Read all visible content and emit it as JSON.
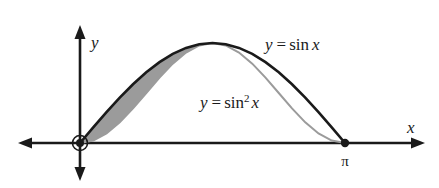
{
  "figure": {
    "background_color": "#ffffff",
    "axes": {
      "x_axis_label": "x",
      "y_axis_label": "y",
      "axis_color": "#1a1a1a",
      "origin_marker": "circled-dot",
      "x_tick_labels": [
        "π"
      ]
    },
    "labels": {
      "sin_label_y": "y",
      "sin_label_eq": "=",
      "sin_label_fn": "sin",
      "sin_label_arg": "x",
      "sin2_label_y": "y",
      "sin2_label_eq": "=",
      "sin2_label_fn": "sin",
      "sin2_label_exp": "2",
      "sin2_label_arg": "x"
    },
    "colors": {
      "sin_curve": "#1a1a1a",
      "sin2_curve": "#9b9b9b",
      "shaded_region": "#9b9b9b",
      "marker": "#1a1a1a"
    }
  },
  "chart_data": {
    "type": "line",
    "title": "",
    "xlabel": "x",
    "ylabel": "y",
    "xlim": [
      0,
      3.14159
    ],
    "ylim": [
      0,
      1
    ],
    "grid": false,
    "legend": "inline-curve-labels",
    "annotations": [
      {
        "text": "y = sin x",
        "x": 2.25,
        "y": 0.93
      },
      {
        "text": "y = sin² x",
        "x": 1.55,
        "y": 0.48
      },
      {
        "text": "π",
        "x": 3.14159,
        "y": -0.12
      }
    ],
    "markers": [
      {
        "label": "origin",
        "x": 0,
        "y": 0,
        "style": "circled-dot"
      },
      {
        "label": "π",
        "x": 3.14159,
        "y": 0,
        "style": "filled-dot"
      }
    ],
    "shaded_between": {
      "upper_series": "y = sin x",
      "lower_series": "y = sin² x",
      "x_from": 0,
      "x_to": 1.5708,
      "color": "#9b9b9b"
    },
    "series": [
      {
        "name": "y = sin x",
        "color": "#1a1a1a",
        "width": 2.6,
        "x": [
          0,
          0.1571,
          0.3142,
          0.4712,
          0.6283,
          0.7854,
          0.9425,
          1.0996,
          1.2566,
          1.4137,
          1.5708,
          1.7279,
          1.885,
          2.042,
          2.1991,
          2.3562,
          2.5133,
          2.6704,
          2.8274,
          2.9845,
          3.1416
        ],
        "values": [
          0,
          0.1564,
          0.309,
          0.454,
          0.5878,
          0.7071,
          0.809,
          0.891,
          0.9511,
          0.9877,
          1,
          0.9877,
          0.9511,
          0.891,
          0.809,
          0.7071,
          0.5878,
          0.454,
          0.309,
          0.1564,
          0
        ]
      },
      {
        "name": "y = sin² x",
        "color": "#9b9b9b",
        "width": 2.0,
        "x": [
          0,
          0.1571,
          0.3142,
          0.4712,
          0.6283,
          0.7854,
          0.9425,
          1.0996,
          1.2566,
          1.4137,
          1.5708,
          1.7279,
          1.885,
          2.042,
          2.1991,
          2.3562,
          2.5133,
          2.6704,
          2.8274,
          2.9845,
          3.1416
        ],
        "values": [
          0,
          0.0245,
          0.0955,
          0.2061,
          0.3455,
          0.5,
          0.6545,
          0.7939,
          0.9045,
          0.9755,
          1,
          0.9755,
          0.9045,
          0.7939,
          0.6545,
          0.5,
          0.3455,
          0.2061,
          0.0955,
          0.0245,
          0
        ]
      }
    ]
  }
}
